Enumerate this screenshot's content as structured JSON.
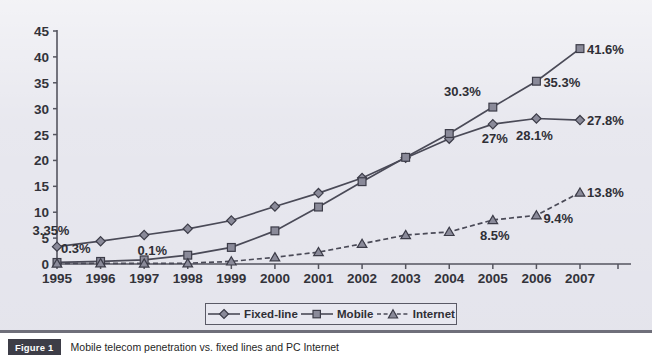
{
  "figure": {
    "tag": "Figure 1",
    "caption": "Mobile telecom penetration vs. fixed lines and PC Internet"
  },
  "legend": {
    "position": "bottom-center",
    "items": [
      {
        "label": "Fixed-line",
        "marker": "diamond-marker-icon",
        "line": "solid"
      },
      {
        "label": "Mobile",
        "marker": "square-marker-icon",
        "line": "solid"
      },
      {
        "label": "Internet",
        "marker": "triangle-marker-icon",
        "line": "dashed"
      }
    ]
  },
  "colors": {
    "plot_background": "#e4e4ec",
    "line": "#4a4a57",
    "marker_fill": "#8a8a99",
    "marker_stroke": "#3c3c48",
    "axis": "#55555f",
    "text": "#2c2c33",
    "figure_tag_bg": "#3d3d47"
  },
  "chart_data": {
    "type": "line",
    "title": "Mobile telecom penetration vs. fixed lines and PC Internet",
    "xlabel": "",
    "ylabel": "",
    "x": [
      1995,
      1996,
      1997,
      1998,
      1999,
      2000,
      2001,
      2002,
      2003,
      2004,
      2005,
      2006,
      2007
    ],
    "categories": [
      "1995",
      "1996",
      "1997",
      "1998",
      "1999",
      "2000",
      "2001",
      "2002",
      "2003",
      "2004",
      "2005",
      "2006",
      "2007"
    ],
    "yticks": [
      0,
      5,
      10,
      15,
      20,
      25,
      30,
      35,
      40,
      45
    ],
    "ylim": [
      0,
      45
    ],
    "grid": false,
    "legend_position": "bottom",
    "series": [
      {
        "name": "Fixed-line",
        "marker": "diamond",
        "line_style": "solid",
        "values": [
          3.35,
          4.4,
          5.6,
          6.8,
          8.4,
          11.1,
          13.7,
          16.6,
          20.5,
          24.2,
          27.0,
          28.1,
          27.8
        ]
      },
      {
        "name": "Mobile",
        "marker": "square",
        "line_style": "solid",
        "values": [
          0.3,
          0.5,
          0.8,
          1.7,
          3.2,
          6.4,
          11.0,
          15.9,
          20.6,
          25.2,
          30.3,
          35.3,
          41.6
        ]
      },
      {
        "name": "Internet",
        "marker": "triangle",
        "line_style": "dashed",
        "values": [
          0.1,
          0.15,
          0.1,
          0.15,
          0.5,
          1.3,
          2.3,
          3.9,
          5.6,
          6.2,
          8.5,
          9.4,
          13.8
        ]
      }
    ],
    "annotations": [
      {
        "text": "3.35%",
        "series": "Fixed-line",
        "x": 1995,
        "value": 3.35
      },
      {
        "text": "0.3%",
        "series": "Mobile",
        "x": 1995,
        "value": 0.3
      },
      {
        "text": "0.1%",
        "series": "Internet",
        "x": 1997,
        "value": 0.1
      },
      {
        "text": "30.3%",
        "series": "Mobile",
        "x": 2005,
        "value": 30.3
      },
      {
        "text": "35.3%",
        "series": "Mobile",
        "x": 2006,
        "value": 35.3
      },
      {
        "text": "41.6%",
        "series": "Mobile",
        "x": 2007,
        "value": 41.6
      },
      {
        "text": "27%",
        "series": "Fixed-line",
        "x": 2005,
        "value": 27.0
      },
      {
        "text": "28.1%",
        "series": "Fixed-line",
        "x": 2006,
        "value": 28.1
      },
      {
        "text": "27.8%",
        "series": "Fixed-line",
        "x": 2007,
        "value": 27.8
      },
      {
        "text": "8.5%",
        "series": "Internet",
        "x": 2005,
        "value": 8.5
      },
      {
        "text": "9.4%",
        "series": "Internet",
        "x": 2006,
        "value": 9.4
      },
      {
        "text": "13.8%",
        "series": "Internet",
        "x": 2007,
        "value": 13.8
      }
    ]
  }
}
